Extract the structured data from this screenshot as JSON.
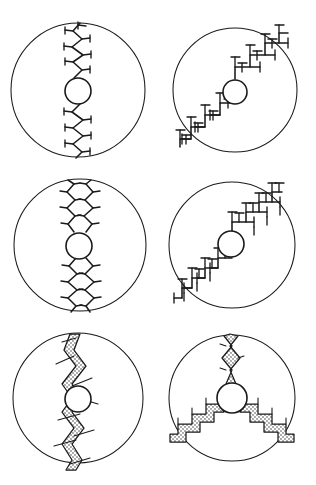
{
  "figure": {
    "title": "",
    "background_color": "#ffffff",
    "ink_color": "#1a1a1a",
    "width": 316,
    "height": 485,
    "panel_count": 6,
    "layout": "2 columns x 3 rows"
  },
  "panels": [
    {
      "id": "panel-a",
      "position": "top-left",
      "label": "",
      "domain": {
        "cx": 78,
        "cy": 90,
        "r": 67
      },
      "nucleus": {
        "cx": 78,
        "cy": 91,
        "r": 13
      },
      "pattern_type": "zigzag-needle",
      "arm_count": 2,
      "arm_directions_deg": [
        90,
        270
      ],
      "branch_style": "short perpendicular twigs",
      "texture": "line",
      "description": "Single vertical zigzag needle crossing the circle with short side twigs"
    },
    {
      "id": "panel-b",
      "position": "top-right",
      "label": "",
      "domain": {
        "cx": 235,
        "cy": 90,
        "r": 62
      },
      "nucleus": {
        "cx": 235,
        "cy": 92,
        "r": 12
      },
      "pattern_type": "orthogonal-staircase-dendrite",
      "arm_count": 2,
      "arm_directions_deg": [
        45,
        225
      ],
      "branch_style": "right-angle T branches",
      "texture": "line",
      "description": "Diagonal staircase dendrite with orthogonal T-shaped side branches"
    },
    {
      "id": "panel-c",
      "position": "middle-left",
      "label": "",
      "domain": {
        "cx": 80,
        "cy": 245,
        "r": 66
      },
      "nucleus": {
        "cx": 79,
        "cy": 246,
        "r": 13
      },
      "pattern_type": "parallel-zigzag-needles",
      "arm_count": 2,
      "arm_directions_deg": [
        90,
        270
      ],
      "branch_style": "dense fine twigs",
      "texture": "line",
      "description": "Three parallel wavy zigzag needles forming a vertical band with dense fine twigs"
    },
    {
      "id": "panel-d",
      "position": "middle-right",
      "label": "",
      "domain": {
        "cx": 232,
        "cy": 245,
        "r": 63
      },
      "nucleus": {
        "cx": 231,
        "cy": 244,
        "r": 13
      },
      "pattern_type": "dense-orthogonal-dendrite",
      "arm_count": 2,
      "arm_directions_deg": [
        45,
        225
      ],
      "branch_style": "dense right-angle branches, second generation",
      "texture": "line",
      "description": "Diagonal dendrite with dense second-generation orthogonal branching"
    },
    {
      "id": "panel-e",
      "position": "bottom-left",
      "label": "",
      "domain": {
        "cx": 78,
        "cy": 398,
        "r": 65
      },
      "nucleus": {
        "cx": 78,
        "cy": 399,
        "r": 13
      },
      "pattern_type": "stippled-zigzag-band",
      "arm_count": 2,
      "arm_directions_deg": [
        90,
        270
      ],
      "branch_style": "thin crossing line segments",
      "texture": "stipple",
      "description": "Thick stippled zigzag ribbon running vertically with thin crossing branches"
    },
    {
      "id": "panel-f",
      "position": "bottom-right",
      "label": "",
      "domain": {
        "cx": 232,
        "cy": 398,
        "r": 63
      },
      "nucleus": {
        "cx": 232,
        "cy": 398,
        "r": 15
      },
      "pattern_type": "three-arm-stippled-staircase",
      "arm_count": 3,
      "arm_directions_deg": [
        90,
        210,
        330
      ],
      "branch_style": "stepped staircase ribbon",
      "texture": "stipple",
      "description": "Three stippled arms radiating at 120 degrees: one upward zigzag and two downward staircases"
    }
  ],
  "legend": {
    "visible": false,
    "entries": []
  },
  "caption": ""
}
